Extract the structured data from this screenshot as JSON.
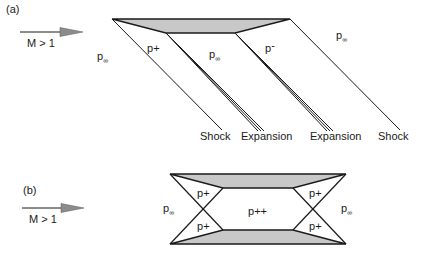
{
  "colors": {
    "line": "#1a1a1a",
    "fill": "#c8c8c8",
    "arrow_head": "#8c8c8c",
    "background": "#ffffff"
  },
  "panel_a": {
    "label": "(a)",
    "flow": {
      "text": "M > 1",
      "arrow_icon": "flow-arrow-icon"
    },
    "regions": [
      {
        "base": "p",
        "sub": "∞",
        "sup": ""
      },
      {
        "base": "p",
        "sub": "",
        "sup": "+"
      },
      {
        "base": "p",
        "sub": "∞",
        "sup": ""
      },
      {
        "base": "p",
        "sub": "",
        "sup": "-"
      },
      {
        "base": "p",
        "sub": "∞",
        "sup": ""
      }
    ],
    "wave_labels": [
      "Shock",
      "Expansion",
      "Expansion",
      "Shock"
    ]
  },
  "panel_b": {
    "label": "(b)",
    "flow": {
      "text": "M > 1",
      "arrow_icon": "flow-arrow-icon"
    },
    "regions": [
      {
        "base": "p",
        "sub": "∞",
        "sup": ""
      },
      {
        "base": "p",
        "sub": "",
        "sup": "+"
      },
      {
        "base": "p",
        "sub": "",
        "sup": "+"
      },
      {
        "base": "p",
        "sub": "",
        "sup": "++"
      },
      {
        "base": "p",
        "sub": "",
        "sup": "+"
      },
      {
        "base": "p",
        "sub": "",
        "sup": "+"
      },
      {
        "base": "p",
        "sub": "∞",
        "sup": ""
      }
    ]
  }
}
